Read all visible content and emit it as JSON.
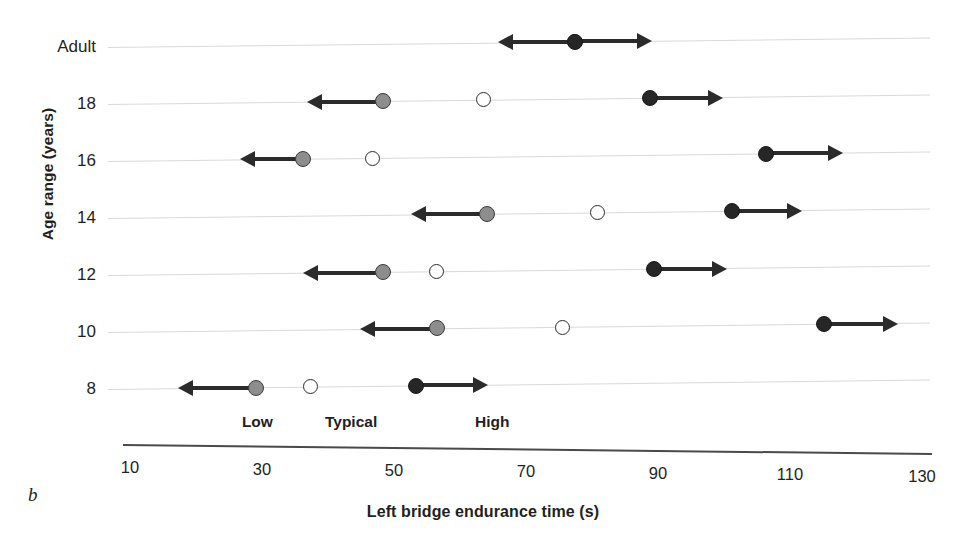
{
  "chart_data": {
    "type": "scatter",
    "title": "",
    "panel_letter": "b",
    "xlabel": "Left bridge endurance time (s)",
    "ylabel": "Age range (years)",
    "xlim": [
      10,
      130
    ],
    "xticks": [
      10,
      30,
      50,
      70,
      90,
      110,
      130
    ],
    "xtick_labels": [
      "10",
      "30",
      "50",
      "70",
      "90",
      "110",
      "130"
    ],
    "grid": false,
    "legend_position": "inline-below-last-row",
    "categories": [
      "Adult",
      "18",
      "16",
      "14",
      "12",
      "10",
      "8"
    ],
    "series": [
      {
        "name": "Low",
        "marker": "filled-gray-circle",
        "color": "#8d8d8d",
        "arrow": "left",
        "values": [
          null,
          48.3,
          36.2,
          64.1,
          48.3,
          56.5,
          29.1
        ],
        "arrow_tips": [
          null,
          36.8,
          26.7,
          52.6,
          36.2,
          44.8,
          17.3
        ]
      },
      {
        "name": "Typical",
        "marker": "open-circle",
        "color": "#ffffff",
        "arrow": "none",
        "values": [
          77.4,
          63.6,
          46.8,
          80.8,
          56.5,
          75.5,
          37.3
        ],
        "arrow_tips": [
          null,
          null,
          null,
          null,
          null,
          null,
          null
        ]
      },
      {
        "name": "High",
        "marker": "filled-black-circle",
        "color": "#262626",
        "arrow": "right",
        "values": [
          77.4,
          88.8,
          106.4,
          101.2,
          89.4,
          115.2,
          53.3
        ],
        "arrow_tips": [
          89.1,
          99.8,
          118.0,
          111.8,
          100.5,
          126.4,
          64.2
        ]
      }
    ],
    "adult_row_note": "Adult row shows a single open circle at 77.4 s with a bidirectional arrow from 65.8 to 89.1 s",
    "adult_left_tip": 65.8,
    "legend_labels": [
      {
        "label": "Low",
        "x": 29.3
      },
      {
        "label": "Typical",
        "x": 43.5
      },
      {
        "label": "High",
        "x": 64.9
      }
    ]
  },
  "axes": {
    "y_title": "Age range (years)",
    "x_title": "Left bridge endurance time (s)",
    "y_categories": [
      "Adult",
      "18",
      "16",
      "14",
      "12",
      "10",
      "8"
    ],
    "x_tick_labels": [
      "10",
      "30",
      "50",
      "70",
      "90",
      "110",
      "130"
    ]
  },
  "legend": {
    "low": "Low",
    "typical": "Typical",
    "high": "High"
  },
  "caption": {
    "panel": "b"
  }
}
